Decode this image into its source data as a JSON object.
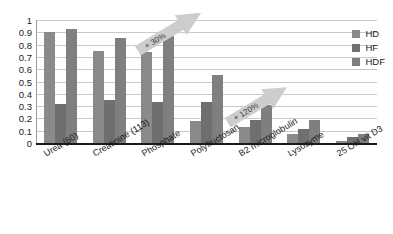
{
  "chart_data": {
    "type": "bar",
    "title": "",
    "subtitle": "",
    "xlabel": "",
    "ylabel": "",
    "ylim": [
      0,
      1
    ],
    "yticks": [
      "0",
      "0.1",
      "0.2",
      "0.3",
      "0.4",
      "0.5",
      "0.6",
      "0.7",
      "0.8",
      "0.9",
      "1"
    ],
    "ytick_values": [
      0,
      0.1,
      0.2,
      0.3,
      0.4,
      0.5,
      0.6,
      0.7,
      0.8,
      0.9,
      1
    ],
    "grid": true,
    "legend_position": "top-right",
    "categories": [
      "Urea (60)",
      "Creatinine (113)",
      "Phosphate",
      "Polyfructosan",
      "B2 microglobulin",
      "Lysozyme",
      "25 OH vit D3"
    ],
    "series": [
      {
        "name": "HD",
        "values": [
          0.9,
          0.75,
          0.74,
          0.18,
          0.13,
          0.07,
          0.02
        ]
      },
      {
        "name": "HF",
        "values": [
          0.32,
          0.35,
          0.33,
          0.33,
          0.19,
          0.11,
          0.05
        ]
      },
      {
        "name": "HDF",
        "values": [
          0.93,
          0.85,
          0.87,
          0.55,
          0.31,
          0.19,
          0.07
        ]
      }
    ],
    "annotations": [
      {
        "label": "+ 30%",
        "target_category": "Phosphate"
      },
      {
        "label": "+ 120%",
        "target_category": "B2 microglobulin"
      }
    ],
    "colors": {
      "series_hd": "#8a8a8a",
      "series_hf": "#6f6f6f",
      "series_hdf": "#7f7f7f",
      "gridline": "#c9c9c9",
      "axis": "#1a1a1a",
      "annotation_arrow": "#cdcdcd",
      "background": "#ffffff"
    }
  }
}
